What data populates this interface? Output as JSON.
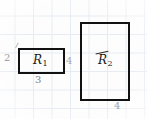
{
  "figure": {
    "type": "geometry-sketch",
    "medium": "graph-paper",
    "grid": {
      "cell_size_px": 18.5,
      "color": "#dfe6ee"
    },
    "stroke_color": "#111111",
    "annotation_color": "#8d8d92"
  },
  "shapes": [
    {
      "id": "rect-1",
      "label": "R",
      "subscript": "1",
      "left_label": "2",
      "bottom_label": "3",
      "width_units": 3,
      "height_units": 2
    },
    {
      "id": "rect-2",
      "label": "R",
      "subscript": "2",
      "bottom_label": "4",
      "width_units": 3,
      "height_units": 4
    }
  ],
  "annotations": {
    "rect1_height": "2",
    "rect1_width": "3",
    "between_rectangles": "4",
    "rect2_width": "4"
  },
  "chart_data": {
    "type": "table",
    "title": "",
    "categories": [
      "R1",
      "R2"
    ],
    "series": [
      {
        "name": "width",
        "values": [
          3,
          4
        ]
      },
      {
        "name": "height",
        "values": [
          2,
          6
        ]
      }
    ],
    "xlabel": "",
    "ylabel": ""
  }
}
